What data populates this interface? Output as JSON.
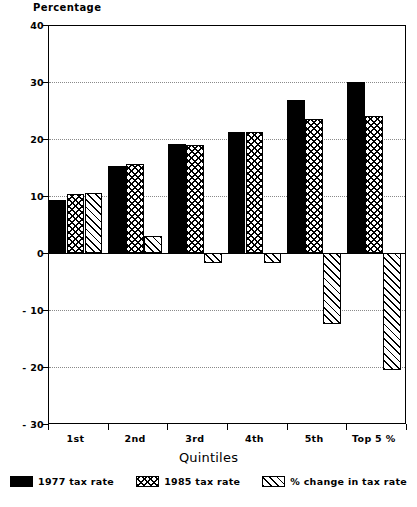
{
  "chart_data": {
    "type": "bar",
    "title": "",
    "ylabel": "Percentage",
    "xlabel": "Quintiles",
    "categories": [
      "1st",
      "2nd",
      "3rd",
      "4th",
      "5th",
      "Top 5 %"
    ],
    "series": [
      {
        "name": "1977 tax rate",
        "pattern": "solid",
        "values": [
          9.3,
          15.3,
          19.2,
          21.3,
          26.8,
          30.0
        ]
      },
      {
        "name": "1985 tax rate",
        "pattern": "cross-hatch",
        "values": [
          10.3,
          15.7,
          19.0,
          21.3,
          23.5,
          24.0
        ]
      },
      {
        "name": "% change in tax rate",
        "pattern": "diagonal-stripe",
        "values": [
          10.5,
          3.0,
          -1.7,
          -1.7,
          -12.5,
          -20.5
        ]
      }
    ],
    "ylim": [
      -30,
      40
    ],
    "ytick_values": [
      40,
      30,
      20,
      10,
      0,
      -10,
      -20,
      -30
    ],
    "ytick_labels": [
      "40",
      "30",
      "20",
      "10",
      "0",
      "- 10",
      "- 20",
      "- 30"
    ],
    "grid": true,
    "grid_axis": "y",
    "legend_position": "bottom"
  },
  "legend": {
    "items": [
      {
        "label": "1977 tax rate"
      },
      {
        "label": "1985 tax rate"
      },
      {
        "label": "% change in tax rate"
      }
    ]
  }
}
